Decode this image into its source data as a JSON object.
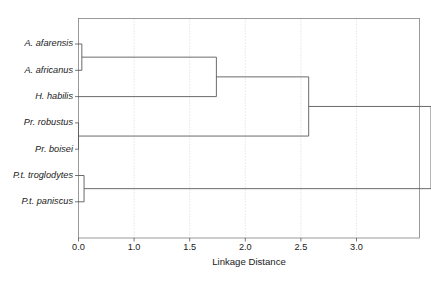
{
  "chart_data": {
    "type": "dendrogram",
    "title": "",
    "xlabel": "Linkage Distance",
    "ylabel": "",
    "xlim": [
      0.0,
      3.9
    ],
    "grid": true,
    "legend": null,
    "orientation": "horizontal",
    "leaves": [
      "A. afarensis",
      "A. africanus",
      "H. habilis",
      "Pr. robustus",
      "Pr. boisei",
      "P.t. troglodytes",
      "P.t. paniscus"
    ],
    "tick_labels": [
      "0.0",
      "1.0",
      "1.5",
      "2.0",
      "2.5",
      "3.0"
    ],
    "tick_values": [
      0.0,
      0.5,
      1.0,
      1.5,
      2.0,
      2.5
    ],
    "gridline_values": [
      0.5,
      1.0,
      1.5,
      2.0,
      2.5
    ],
    "merges": [
      {
        "id": "m1",
        "label": "A. afarensis + A. africanus",
        "children": [
          "A. afarensis",
          "A. africanus"
        ],
        "distance": 0.03
      },
      {
        "id": "m2",
        "label": "Pr. robustus + Pr. boisei",
        "children": [
          "Pr. robustus",
          "Pr. boisei"
        ],
        "distance": 0.0
      },
      {
        "id": "m3",
        "label": "P.t. troglodytes + P.t. paniscus",
        "children": [
          "P.t. troglodytes",
          "P.t. paniscus"
        ],
        "distance": 0.05
      },
      {
        "id": "m4",
        "label": "Australopithecus cluster + H. habilis",
        "children": [
          "m1",
          "H. habilis"
        ],
        "distance": 1.24
      },
      {
        "id": "m5",
        "label": "Hominin cluster + Paranthropus",
        "children": [
          "m4",
          "m2"
        ],
        "distance": 2.07
      },
      {
        "id": "m6",
        "label": "Hominins + Pan",
        "children": [
          "m5",
          "m3"
        ],
        "distance": 3.17
      }
    ]
  },
  "axis": {
    "x_title": "Linkage Distance"
  }
}
